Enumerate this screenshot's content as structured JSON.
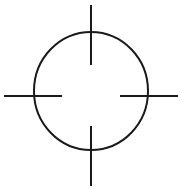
{
  "figure": {
    "type": "crosshair-symbol",
    "stroke_color": "#1a1a1a",
    "background_color": "#ffffff",
    "circle": {
      "cx": 91,
      "cy": 91,
      "rx": 57,
      "ry": 59,
      "stroke_width": 2
    },
    "ticks": [
      {
        "name": "top",
        "x1": 91,
        "y1": 5,
        "x2": 91,
        "y2": 65
      },
      {
        "name": "bottom",
        "x1": 91,
        "y1": 126,
        "x2": 91,
        "y2": 186
      },
      {
        "name": "left",
        "x1": 4,
        "y1": 96,
        "x2": 62,
        "y2": 96
      },
      {
        "name": "right",
        "x1": 120,
        "y1": 96,
        "x2": 178,
        "y2": 96
      }
    ]
  }
}
